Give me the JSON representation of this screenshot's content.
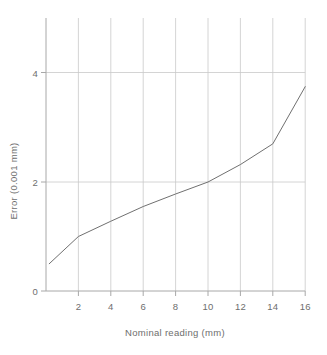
{
  "chart_data": {
    "type": "line",
    "title": "",
    "xlabel": "Nominal reading (mm)",
    "ylabel": "Error (0.001 mm)",
    "xlim": [
      0,
      16
    ],
    "ylim": [
      0,
      4.6
    ],
    "xticks": [
      2,
      4,
      6,
      8,
      10,
      12,
      14,
      16
    ],
    "xtick_labels": [
      "2",
      "4",
      "6",
      "8",
      "10",
      "12",
      "14",
      "16"
    ],
    "yticks": [
      0,
      2,
      4
    ],
    "ytick_labels": [
      "0",
      "2",
      "4"
    ],
    "grid": {
      "vertical": true,
      "horizontal": true,
      "color": "#c8c8c8"
    },
    "legend": null,
    "series": [
      {
        "name": "Error",
        "color": "#707070",
        "line_width": 1,
        "x": [
          0.2,
          2,
          4,
          6,
          8,
          10,
          12,
          14,
          16
        ],
        "values": [
          0.5,
          1.0,
          1.28,
          1.55,
          1.78,
          2.0,
          2.32,
          2.7,
          3.75
        ]
      }
    ]
  },
  "axes": {
    "x_axis_name": "x-axis",
    "y_axis_name": "y-axis"
  }
}
